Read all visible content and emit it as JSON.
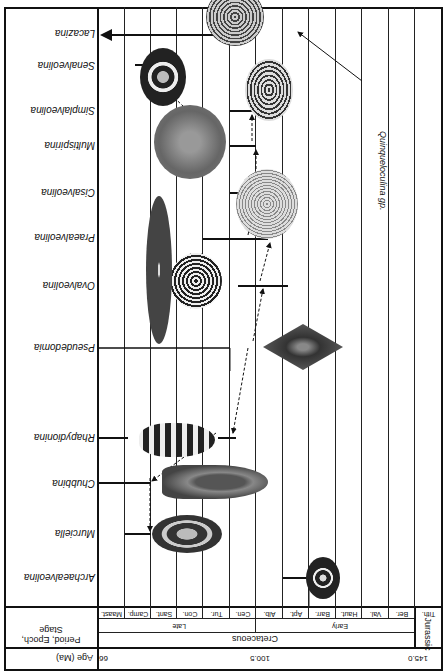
{
  "figure": {
    "legend": {
      "age_label": "Age (Ma)",
      "period_epoch_stage_label": "Period, Epoch, Stage",
      "age_ticks": [
        {
          "value": "145.0",
          "x": 30
        },
        {
          "value": "100.5",
          "x": 186
        },
        {
          "value": "66",
          "x": 347
        }
      ],
      "periods": [
        {
          "name": "Jurassic",
          "x0": 6,
          "x1": 33
        },
        {
          "name": "Cretaceous",
          "x0": 33,
          "x1": 350
        }
      ],
      "epochs": [
        {
          "name": "Early",
          "x0": 33,
          "x1": 192
        },
        {
          "name": "Late",
          "x0": 192,
          "x1": 350
        }
      ],
      "stages": [
        "Tith.",
        "Ber.",
        "Val.",
        "Haut.",
        "Barr.",
        "Apt.",
        "Alb.",
        "Cen.",
        "Tur.",
        "Con.",
        "Sant.",
        "Camp.",
        "Maast."
      ]
    },
    "genera": [
      "Archaealveolina",
      "Murciella",
      "Chubbina",
      "Rhapydionina",
      "Pseudedomia",
      "Ovalveolina",
      "Praealveolina",
      "Cisalveolina",
      "Multispirina",
      "Simplalveolina",
      "Senalveolina",
      "Lacazina"
    ],
    "annotation": "Quinqueloculina gp."
  },
  "chart_data": {
    "type": "range-chart",
    "title": "",
    "xlabel": "Age (Ma)",
    "ylabel": "Genus",
    "x_axis": "Geologic stages, Tithonian (Late Jurassic) to Maastrichtian (Late Cretaceous)",
    "age_ticks_ma": [
      145.0,
      100.5,
      66
    ],
    "stages": [
      "Tith.",
      "Ber.",
      "Val.",
      "Haut.",
      "Barr.",
      "Apt.",
      "Alb.",
      "Cen.",
      "Tur.",
      "Con.",
      "Sant.",
      "Camp.",
      "Maast."
    ],
    "ranges": [
      {
        "genus": "Archaealveolina",
        "first": "Alb.",
        "last": "Alb."
      },
      {
        "genus": "Murciella",
        "first": "Camp.",
        "last": "Maast."
      },
      {
        "genus": "Chubbina",
        "first": "Camp.",
        "last": "Maast."
      },
      {
        "genus": "Rhapydionina",
        "first": "Camp.",
        "last": "Maast."
      },
      {
        "genus": "Pseudedomia",
        "first": "Cen.",
        "last": "Maast."
      },
      {
        "genus": "Ovalveolina",
        "first": "Alb.",
        "last": "Cen."
      },
      {
        "genus": "Praealveolina",
        "first": "Alb.",
        "last": "Tur."
      },
      {
        "genus": "Cisalveolina",
        "first": "Cen.",
        "last": "Cen."
      },
      {
        "genus": "Multispirina",
        "first": "Cen.",
        "last": "Cen."
      },
      {
        "genus": "Simplalveolina",
        "first": "Cen.",
        "last": "Cen."
      },
      {
        "genus": "Senalveolina",
        "first": "Maast.",
        "last": "Maast."
      },
      {
        "genus": "Lacazina",
        "first": "Cen.",
        "last": "Recent (arrow)"
      }
    ],
    "phylogenetic_links": [
      {
        "from": "Pseudedomia",
        "to": "Rhapydionina"
      },
      {
        "from": "Rhapydionina",
        "to": "Chubbina"
      },
      {
        "from": "Chubbina",
        "to": "Murciella"
      },
      {
        "from": "Pseudedomia",
        "to": "Ovalveolina"
      },
      {
        "from": "Ovalveolina",
        "to": "Praealveolina"
      },
      {
        "from": "Praealveolina",
        "to": "Cisalveolina"
      },
      {
        "from": "Cisalveolina",
        "to": "Multispirina"
      },
      {
        "from": "Multispirina",
        "to": "Simplalveolina"
      },
      {
        "from": "Multispirina",
        "to": "Senalveolina"
      }
    ],
    "annotation": "Quinqueloculina gp. (arrow pointing to Lacazina specimen)",
    "orientation_note": "Figure is displayed rotated 180 degrees"
  }
}
